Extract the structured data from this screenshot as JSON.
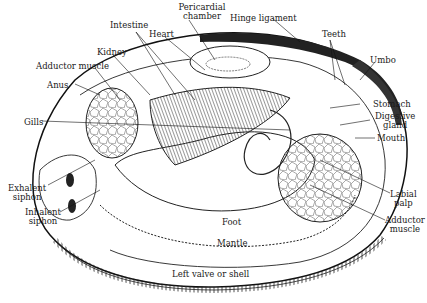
{
  "figure": {
    "caption": ""
  },
  "labels": {
    "pericardial_chamber": "Pericardial\nchamber",
    "pericardial_l1": "Pericardial",
    "pericardial_l2": "chamber",
    "hinge_ligament": "Hinge ligament",
    "intestine": "Intestine",
    "heart": "Heart",
    "teeth": "Teeth",
    "kidney": "Kidney",
    "adductor_muscle_anterior": "Adductor muscle",
    "umbo": "Umbo",
    "anus": "Anus",
    "stomach": "Stomach",
    "gills": "Gills",
    "digestive_l1": "Digestive",
    "digestive_l2": "gland",
    "mouth": "Mouth",
    "exhalent_l1": "Exhalent",
    "exhalent_l2": "siphon",
    "inhalent_l1": "Inhalent",
    "inhalent_l2": "siphon",
    "labial_l1": "Labial",
    "labial_l2": "palp",
    "adductor_post_l1": "Adductor",
    "adductor_post_l2": "muscle",
    "foot": "Foot",
    "mantle": "Mantle",
    "left_valve": "Left valve or shell"
  },
  "colors": {
    "ink": "#1a1a1a",
    "paper": "#ffffff",
    "hatch": "#555555"
  }
}
